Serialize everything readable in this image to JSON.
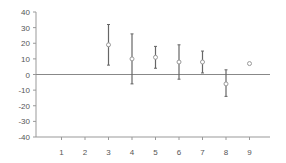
{
  "chart_data": {
    "type": "scatter",
    "title": "",
    "xlabel": "",
    "ylabel": "",
    "x_ticks": [
      "1",
      "2",
      "3",
      "4",
      "5",
      "6",
      "7",
      "8",
      "9"
    ],
    "y_ticks": [
      "40",
      "30",
      "20",
      "10",
      "0",
      "-10",
      "-20",
      "-30",
      "-40"
    ],
    "ylim": [
      -40,
      40
    ],
    "xlim": [
      0,
      10
    ],
    "grid": false,
    "legend": null,
    "series": [
      {
        "name": "mean with error bars",
        "points": [
          {
            "x": 3,
            "y": 19,
            "low": 6,
            "high": 32
          },
          {
            "x": 4,
            "y": 10,
            "low": -6,
            "high": 26
          },
          {
            "x": 5,
            "y": 11,
            "low": 4,
            "high": 18
          },
          {
            "x": 6,
            "y": 8,
            "low": -3,
            "high": 19
          },
          {
            "x": 7,
            "y": 8,
            "low": 1,
            "high": 15
          },
          {
            "x": 8,
            "y": -6,
            "low": -14,
            "high": 3
          },
          {
            "x": 9,
            "y": 7,
            "low": null,
            "high": null
          }
        ]
      }
    ],
    "colors": {
      "marker": "#999999",
      "errorbar": "#666666",
      "axis": "#999999",
      "zero_line": "#888888"
    }
  }
}
